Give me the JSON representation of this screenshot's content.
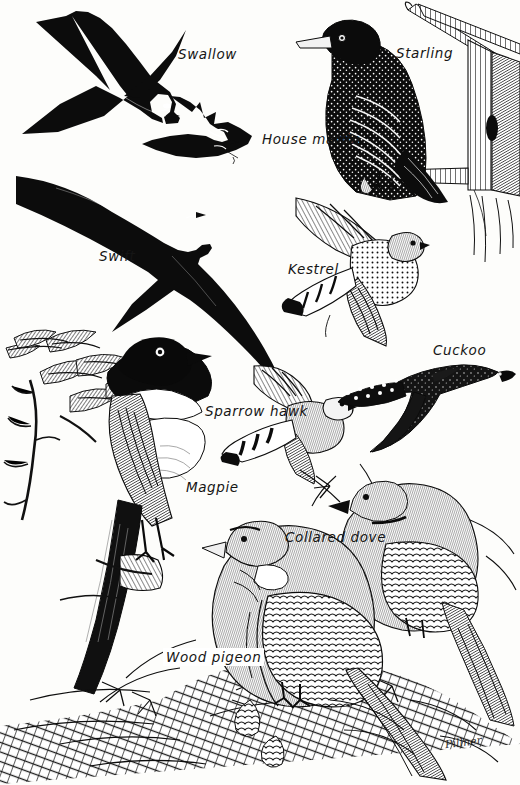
{
  "plate": {
    "title": "British Birds Identification Plate",
    "style": "black-and-white scraperboard / engraving illustration",
    "background_color": "#fdfdfb",
    "ink_color": "#101010",
    "width": 520,
    "height": 785,
    "signature": "Pillner"
  },
  "labels": [
    {
      "id": "swallow",
      "text": "Swallow",
      "x": 178,
      "y": 46,
      "boxed": false
    },
    {
      "id": "starling",
      "text": "Starling",
      "x": 396,
      "y": 45,
      "boxed": false
    },
    {
      "id": "house-martin",
      "text": "House martin",
      "x": 262,
      "y": 131,
      "boxed": false
    },
    {
      "id": "swift",
      "text": "Swift",
      "x": 99,
      "y": 248,
      "boxed": false
    },
    {
      "id": "kestrel",
      "text": "Kestrel",
      "x": 288,
      "y": 261,
      "boxed": false
    },
    {
      "id": "cuckoo",
      "text": "Cuckoo",
      "x": 433,
      "y": 342,
      "boxed": false
    },
    {
      "id": "sparrowhawk",
      "text": "Sparrow hawk",
      "x": 205,
      "y": 403,
      "boxed": false
    },
    {
      "id": "magpie",
      "text": "Magpie",
      "x": 186,
      "y": 479,
      "boxed": false
    },
    {
      "id": "collared-dove",
      "text": "Collared dove",
      "x": 285,
      "y": 529,
      "boxed": false
    },
    {
      "id": "wood-pigeon",
      "text": "Wood pigeon",
      "x": 166,
      "y": 650,
      "boxed": true
    }
  ],
  "birds": [
    {
      "id": "swallow",
      "common_name": "Swallow",
      "depiction": "black flying silhouette, deeply forked tail streamers, pointed wings, in flight viewed from side"
    },
    {
      "id": "house-martin",
      "common_name": "House martin",
      "depiction": "black flying silhouette with white rump patch, shallow forked tail"
    },
    {
      "id": "swift",
      "common_name": "Swift",
      "depiction": "large black flying silhouette, scythe-shaped sickle wings, short forked tail"
    },
    {
      "id": "starling",
      "common_name": "Starling",
      "depiction": "speckled dark bird perched on a wooden post / nest box bracket, pointed pale bill"
    },
    {
      "id": "kestrel",
      "common_name": "Kestrel",
      "depiction": "hovering falcon in flight, barred wings, spotted underparts, banded tail"
    },
    {
      "id": "sparrowhawk",
      "common_name": "Sparrow hawk",
      "depiction": "short rounded wings, long barred tail, flying hawk"
    },
    {
      "id": "cuckoo",
      "common_name": "Cuckoo",
      "depiction": "flying bird with long barred tail, pointed wings, grey upperparts"
    },
    {
      "id": "magpie",
      "common_name": "Magpie",
      "depiction": "large pied bird perched on a branch with leaves, long graduated tail, black and white plumage"
    },
    {
      "id": "collared-dove",
      "common_name": "Collared dove",
      "depiction": "pale dove perched in conifer foliage, black half-collar on neck"
    },
    {
      "id": "wood-pigeon",
      "common_name": "Wood pigeon",
      "depiction": "large pigeon perched in conifer foliage, white neck patch, broad scaled wings"
    }
  ]
}
